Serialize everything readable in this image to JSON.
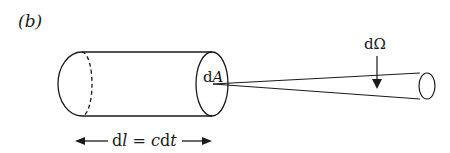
{
  "figure": {
    "panel_label": "(b)",
    "area_label": {
      "d": "d",
      "sym": "A"
    },
    "solid_angle_label": {
      "d": "d",
      "sym": "Ω"
    },
    "length_label": {
      "d1": "d",
      "l": "l",
      "eq": " = ",
      "c": "c",
      "d2": "d",
      "t": "t"
    },
    "stroke_color": "#1a1a1a",
    "background": "#ffffff"
  }
}
